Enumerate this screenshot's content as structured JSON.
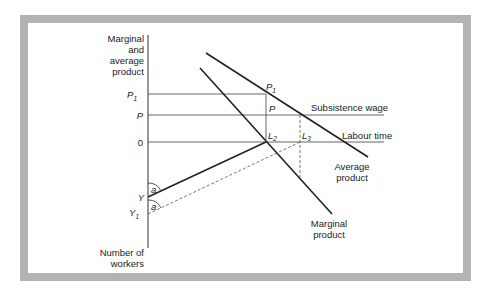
{
  "diagram": {
    "y_axis_label": [
      "Marginal",
      "and",
      "average",
      "product"
    ],
    "bottom_axis_label": [
      "Number of",
      "workers"
    ],
    "tick_labels": {
      "p1": {
        "main": "P",
        "sub": "1"
      },
      "p": "P",
      "zero": "0",
      "y": "Y",
      "y1": {
        "main": "Y",
        "sub": "1"
      }
    },
    "point_labels": {
      "p1": {
        "main": "P",
        "sub": "1"
      },
      "p": "P",
      "l2": {
        "main": "L",
        "sub": "2"
      },
      "l3": {
        "main": "L",
        "sub": "3"
      }
    },
    "line_labels": {
      "subsistence_wage": "Subsistence wage",
      "labour_time": "Labour time",
      "average_product": [
        "Average",
        "product"
      ],
      "marginal_product": [
        "Marginal",
        "product"
      ]
    },
    "angle_labels": [
      "a",
      "a"
    ],
    "colors": {
      "frame": "#b3b3b3",
      "line": "#222222",
      "thin_line": "#555555"
    }
  }
}
